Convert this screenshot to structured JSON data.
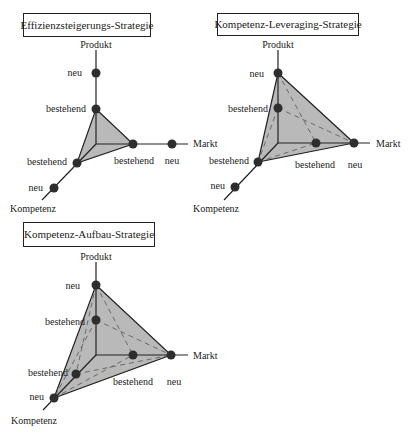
{
  "colors": {
    "fill": "#b9b9b9",
    "line": "#222222",
    "dot": "#2e2e2e",
    "dash": "#555555"
  },
  "axis_labels": {
    "product": "Produkt",
    "market": "Markt",
    "competence": "Kompetenz"
  },
  "level_labels": {
    "existing": "bestehend",
    "new": "neu"
  },
  "diagrams": [
    {
      "title": "Effizienzsteigerungs-Strategie",
      "product_level": "bestehend",
      "market_level": "bestehend",
      "competence_level": "bestehend"
    },
    {
      "title": "Kompetenz-Leveraging-Strategie",
      "product_level": "neu",
      "market_level": "neu",
      "competence_level": "bestehend"
    },
    {
      "title": "Kompetenz-Aufbau-Strategie",
      "product_level": "neu",
      "market_level": "neu",
      "competence_level": "neu"
    }
  ]
}
